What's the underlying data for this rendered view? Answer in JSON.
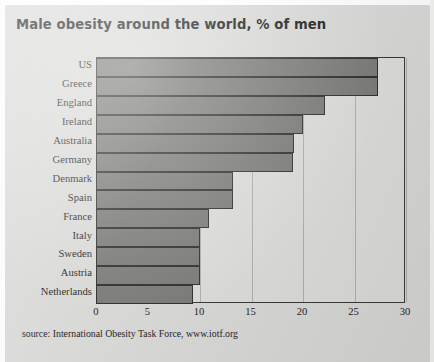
{
  "title": "Male obesity around the world, % of men",
  "source": "source: International Obesity Task Force, www.iotf.org",
  "colors": {
    "page_background": "#d8d8d6",
    "plot_background": "#dcdcda",
    "bar_fill": "#7a7a78",
    "bar_outline": "#2e2e2e",
    "text": "#1f1f1f",
    "title_text": "#1d1d1d"
  },
  "chart_data": {
    "type": "bar",
    "orientation": "horizontal",
    "title": "Male obesity around the world, % of men",
    "xlabel": "",
    "ylabel": "",
    "xlim": [
      0,
      30
    ],
    "xticks": [
      "0",
      "5",
      "10",
      "15",
      "20",
      "25",
      "30"
    ],
    "grid": true,
    "grid_axis": "x",
    "legend": false,
    "annotation": "source: International Obesity Task Force, www.iotf.org",
    "categories": [
      "US",
      "Greece",
      "England",
      "Ireland",
      "Australia",
      "Germany",
      "Denmark",
      "Spain",
      "France",
      "Italy",
      "Sweden",
      "Austria",
      "Netherlands"
    ],
    "values": [
      27.3,
      27.3,
      22.1,
      20.0,
      19.1,
      19.0,
      13.2,
      13.2,
      10.9,
      10.0,
      10.0,
      10.0,
      9.3
    ]
  }
}
